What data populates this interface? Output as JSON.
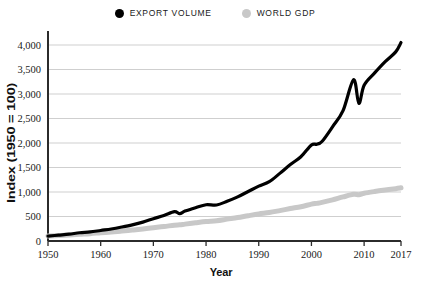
{
  "legend": {
    "position": "top-center",
    "entries": [
      {
        "label": "EXPORT VOLUME",
        "color": "#000000",
        "marker": "filled-circle"
      },
      {
        "label": "WORLD GDP",
        "color": "#c8c8c8",
        "marker": "filled-circle"
      }
    ]
  },
  "chart_data": {
    "type": "line",
    "title": "",
    "subtitle": "",
    "xlabel": "Year",
    "ylabel": "Index (1950 = 100)",
    "xlim": [
      1950,
      2017
    ],
    "ylim": [
      0,
      4000
    ],
    "grid": "horizontal",
    "legend_position": "top-center",
    "ytick_labels": [
      "0",
      "500",
      "1,000",
      "1,500",
      "2,000",
      "2,500",
      "3,000",
      "3,500",
      "4,000"
    ],
    "ytick_values": [
      0,
      500,
      1000,
      1500,
      2000,
      2500,
      3000,
      3500,
      4000
    ],
    "xtick_labels": [
      "1950",
      "1960",
      "1970",
      "1980",
      "1990",
      "2000",
      "2010",
      "2017"
    ],
    "xtick_values": [
      1950,
      1960,
      1970,
      1980,
      1990,
      2000,
      2010,
      2017
    ],
    "x": [
      1950,
      1952,
      1954,
      1956,
      1958,
      1960,
      1962,
      1964,
      1966,
      1968,
      1970,
      1972,
      1974,
      1975,
      1976,
      1978,
      1980,
      1982,
      1984,
      1986,
      1988,
      1990,
      1992,
      1994,
      1996,
      1998,
      2000,
      2001,
      2002,
      2004,
      2006,
      2008,
      2009,
      2010,
      2012,
      2014,
      2016,
      2017
    ],
    "series": [
      {
        "name": "EXPORT VOLUME",
        "color": "#000000",
        "width": 3.2,
        "values": [
          100,
          120,
          140,
          168,
          185,
          215,
          245,
          285,
          330,
          385,
          455,
          520,
          600,
          560,
          610,
          680,
          740,
          735,
          810,
          900,
          1010,
          1120,
          1210,
          1380,
          1560,
          1720,
          1960,
          1975,
          2030,
          2330,
          2660,
          3290,
          2810,
          3180,
          3430,
          3660,
          3860,
          4050
        ]
      },
      {
        "name": "WORLD GDP",
        "color": "#c8c8c8",
        "width": 5.0,
        "values": [
          100,
          112,
          124,
          138,
          150,
          168,
          184,
          203,
          224,
          246,
          272,
          296,
          323,
          330,
          344,
          372,
          398,
          414,
          446,
          478,
          516,
          552,
          580,
          620,
          662,
          700,
          752,
          768,
          788,
          840,
          900,
          952,
          944,
          975,
          1010,
          1040,
          1068,
          1085
        ]
      }
    ]
  }
}
